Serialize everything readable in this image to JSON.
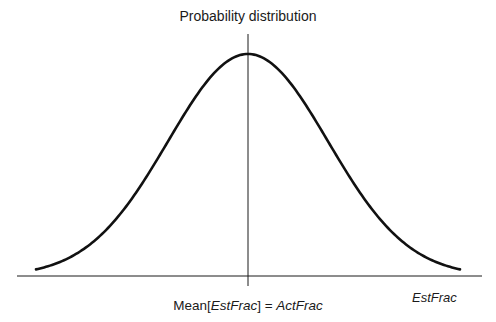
{
  "diagram": {
    "title": "Probability distribution",
    "x_axis_label": "EstFrac",
    "center_label": {
      "prefix": "Mean[",
      "var": "EstFrac",
      "suffix": "] = ",
      "rhs": "ActFrac"
    },
    "curve": "normal distribution (bell curve)",
    "colors": {
      "line": "#1a1a1a",
      "background": "#ffffff"
    }
  },
  "chart_data": {
    "type": "line",
    "title": "Probability distribution",
    "xlabel": "EstFrac",
    "ylabel": "Probability distribution",
    "center_marker": "Mean[EstFrac] = ActFrac",
    "distribution": "normal",
    "x": [
      -2.65,
      -2.0,
      -1.5,
      -1.0,
      -0.5,
      0,
      0.5,
      1.0,
      1.5,
      2.0,
      2.65
    ],
    "values": [
      0.03,
      0.135,
      0.325,
      0.607,
      0.882,
      1.0,
      0.882,
      0.607,
      0.325,
      0.135,
      0.03
    ],
    "grid": false,
    "legend": "none"
  }
}
